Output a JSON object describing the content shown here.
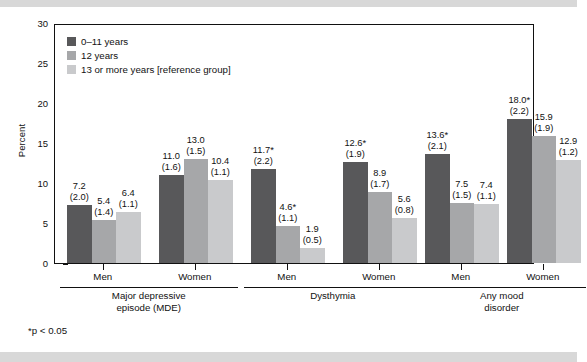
{
  "chart_data": {
    "type": "bar",
    "title": "",
    "xlabel": "",
    "ylabel": "Percent",
    "ylim": [
      0,
      30
    ],
    "yticks": [
      0,
      5,
      10,
      15,
      20,
      25,
      30
    ],
    "grid": false,
    "legend_position": "top-left",
    "footnote": "*p < 0.05",
    "series": [
      {
        "name": "0–11 years",
        "color": "#58585a",
        "values": [
          7.2,
          11.0,
          11.7,
          12.6,
          13.6,
          18.0
        ],
        "labels": [
          "7.2",
          "11.0",
          "11.7*",
          "12.6*",
          "13.6*",
          "18.0*"
        ],
        "se": [
          "(2.0)",
          "(1.6)",
          "(2.2)",
          "(1.9)",
          "(2.1)",
          "(2.2)"
        ]
      },
      {
        "name": "12 years",
        "color": "#a6a7a9",
        "values": [
          5.4,
          13.0,
          4.6,
          8.9,
          7.5,
          15.9
        ],
        "labels": [
          "5.4",
          "13.0",
          "4.6*",
          "8.9",
          "7.5",
          "15.9"
        ],
        "se": [
          "(1.4)",
          "(1.5)",
          "(1.1)",
          "(1.7)",
          "(1.5)",
          "(1.9)"
        ]
      },
      {
        "name": "13 or more years [reference group]",
        "color": "#c9cacc",
        "values": [
          6.4,
          10.4,
          1.9,
          5.6,
          7.4,
          12.9
        ],
        "labels": [
          "6.4",
          "10.4",
          "1.9",
          "5.6",
          "7.4",
          "12.9"
        ],
        "se": [
          "(1.1)",
          "(1.1)",
          "(0.5)",
          "(0.8)",
          "(1.1)",
          "(1.2)"
        ]
      }
    ],
    "categories": [
      "Men",
      "Women",
      "Men",
      "Women",
      "Men",
      "Women"
    ],
    "groups": [
      {
        "label": "Major depressive\nepisode (MDE)",
        "line1": "Major depressive",
        "line2": "episode (MDE)",
        "members": [
          0,
          1
        ]
      },
      {
        "label": "Dysthymia",
        "line1": "Dysthymia",
        "line2": "",
        "members": [
          2,
          3
        ]
      },
      {
        "label": "Any mood\ndisorder",
        "line1": "Any mood",
        "line2": "disorder",
        "members": [
          4,
          5
        ]
      }
    ]
  },
  "legend": {
    "items": [
      {
        "label": "0–11 years",
        "color": "#58585a"
      },
      {
        "label": "12 years",
        "color": "#a6a7a9"
      },
      {
        "label": "13 or more years [reference group]",
        "color": "#c9cacc"
      }
    ]
  },
  "axis": {
    "y_label": "Percent",
    "y_ticks": [
      "30",
      "25",
      "20",
      "15",
      "10",
      "5",
      "0"
    ]
  },
  "footnote": "*p < 0.05"
}
